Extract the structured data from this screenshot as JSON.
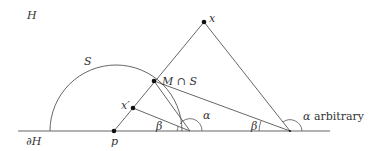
{
  "labels": {
    "halfplane": "H",
    "boundary": "∂H",
    "sphere": "S",
    "point_x": "x",
    "point_xprime": "x′",
    "point_p": "p",
    "intersection": "M ∩ S",
    "alpha": "α",
    "beta_left": "β",
    "beta_right": "β",
    "alpha_arbitrary_symbol": "α",
    "alpha_arbitrary_text": "arbitrary"
  },
  "colors": {
    "line": "#555555",
    "point": "#111111",
    "text": "#333333"
  }
}
